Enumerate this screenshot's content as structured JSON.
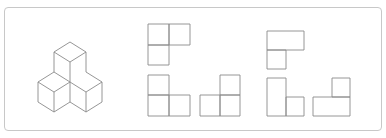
{
  "puzzle": {
    "frame_color": "#c8c8c8",
    "line_color": "#8a8a8a",
    "figure": {
      "type": "isometric-cube-stack",
      "cube_count": 3,
      "description": "One cube on top of two cubes arranged side by side"
    },
    "views": [
      {
        "id": "view-1",
        "description": "L-shape: two cells on top row, one cell below left"
      },
      {
        "id": "view-2",
        "description": "L-shape: tall left column of two cells, one cell at bottom right"
      },
      {
        "id": "view-3",
        "description": "Inverted L: two cells on bottom row, one cell above right"
      },
      {
        "id": "view-4",
        "description": "Wide rectangle on top, one cell below left (no inner divider)"
      },
      {
        "id": "view-5",
        "description": "Tall rectangle left, one cell at bottom right (no inner divider)"
      },
      {
        "id": "view-6",
        "description": "Wide rectangle on bottom, one cell above right (no inner divider)"
      }
    ]
  }
}
